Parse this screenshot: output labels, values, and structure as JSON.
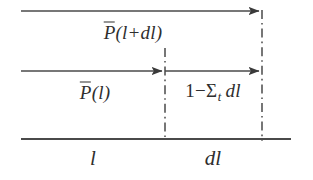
{
  "figure": {
    "type": "physics-diagram",
    "background_color": "#ffffff",
    "line_color": "#444444",
    "text_color": "#2e2e2e",
    "labels": {
      "top_arrow_label": "P̄(l+dl)",
      "top_arrow_label_parts": {
        "p": "P",
        "open": "(",
        "arg": "l+dl",
        "close": ")"
      },
      "middle_arrow_label": "P̄(l)",
      "middle_arrow_label_parts": {
        "p": "P",
        "open": "(",
        "arg": "l",
        "close": ")"
      },
      "attenuation_label": "1−Σt dl",
      "attenuation_parts": {
        "one": "1",
        "minus": "−",
        "sigma": "Σ",
        "subscript": "t",
        "dl": "dl"
      },
      "axis_left_segment": "l",
      "axis_right_segment": "dl"
    },
    "geometry": {
      "top_line": {
        "x1": 21,
        "y1": 11,
        "x2": 262,
        "y2": 11,
        "arrow_at": "end"
      },
      "middle_line": {
        "x1": 21,
        "y1": 71,
        "x2": 262,
        "y2": 71,
        "arrow_at": "mid-and-end"
      },
      "middle_arrow_tip_1_x": 165,
      "middle_arrow_tip_2_x": 262,
      "baseline": {
        "x1": 21,
        "y1": 139,
        "x2": 291,
        "y2": 139
      },
      "dashdot_middle": {
        "x": 165,
        "y1": 48,
        "y2": 141
      },
      "dashdot_right": {
        "x": 262,
        "y1": 10,
        "y2": 141
      }
    }
  }
}
